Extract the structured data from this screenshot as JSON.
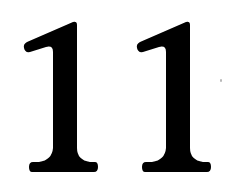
{
  "number": {
    "text": "11",
    "digits": [
      "1",
      "1"
    ],
    "color": "#000000",
    "background": "#ffffff"
  }
}
